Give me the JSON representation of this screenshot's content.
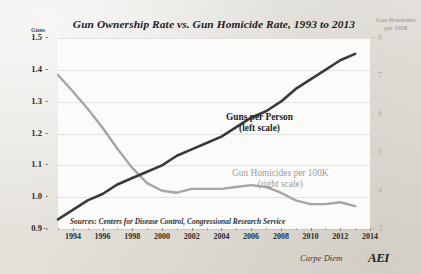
{
  "chart_data": {
    "type": "line",
    "title": "Gun Ownership Rate vs. Gun Homicide Rate, 1993 to 2013",
    "xlabel": "",
    "ylabel": "Guns",
    "y2label": "Gun Homicides per 100K",
    "xlim": [
      1993,
      2014
    ],
    "ylim": [
      0.9,
      1.5
    ],
    "y2lim": [
      3,
      8
    ],
    "grid": true,
    "legend_position": "inline-annotations",
    "x_tick_labels": [
      "1994",
      "1996",
      "1998",
      "2000",
      "2002",
      "2004",
      "2006",
      "2008",
      "2010",
      "2012",
      "2014"
    ],
    "x_ticks": [
      1994,
      1996,
      1998,
      2000,
      2002,
      2004,
      2006,
      2008,
      2010,
      2012,
      2014
    ],
    "y_tick_labels": [
      "1.5",
      "1.4",
      "1.3",
      "1.2",
      "1.1",
      "1.0",
      "0.9"
    ],
    "y_ticks": [
      1.5,
      1.4,
      1.3,
      1.2,
      1.1,
      1.0,
      0.9
    ],
    "y2_tick_labels": [
      "8",
      "7",
      "6",
      "5",
      "4",
      "3"
    ],
    "y2_ticks": [
      8,
      7,
      6,
      5,
      4,
      3
    ],
    "x": [
      1993,
      1994,
      1995,
      1996,
      1997,
      1998,
      1999,
      2000,
      2001,
      2002,
      2003,
      2004,
      2005,
      2006,
      2007,
      2008,
      2009,
      2010,
      2011,
      2012,
      2013
    ],
    "series": [
      {
        "name": "Guns per Person",
        "axis": "left",
        "color": "#3a3a3a",
        "annotation": "Guns per Person",
        "annotation_sub": "(left scale)",
        "values": [
          0.93,
          0.96,
          0.99,
          1.01,
          1.04,
          1.06,
          1.08,
          1.1,
          1.13,
          1.15,
          1.17,
          1.19,
          1.22,
          1.25,
          1.27,
          1.3,
          1.34,
          1.37,
          1.4,
          1.43,
          1.45
        ]
      },
      {
        "name": "Gun Homicides per 100K",
        "axis": "right",
        "color": "#a8a5a0",
        "annotation": "Gun Homicides per 100K",
        "annotation_sub": "(right scale)",
        "values": [
          7.03,
          6.6,
          6.15,
          5.65,
          5.1,
          4.6,
          4.2,
          4.0,
          3.95,
          4.05,
          4.05,
          4.05,
          4.1,
          4.15,
          4.1,
          3.95,
          3.75,
          3.65,
          3.65,
          3.7,
          3.6
        ]
      }
    ],
    "source_note": "Sources: Centers for Disease Control, Congressional Research Service",
    "attribution": "Carpe Diem",
    "logo": "AEI"
  }
}
